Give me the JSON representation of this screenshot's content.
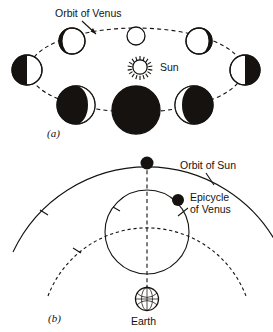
{
  "figure": {
    "title_visible": false,
    "background_color": "#ffffff",
    "ink_color": "#15120f"
  },
  "panel_a": {
    "panel_label": "(a)",
    "labels": {
      "orbit_of_venus": "Orbit of Venus",
      "sun": "Sun"
    },
    "sun_icon_name": "sun-with-rays-icon",
    "orbit": {
      "type": "ellipse-dashed",
      "center_x": 136,
      "center_y": 70,
      "radius_x": 107,
      "radius_y": 42
    },
    "phases": [
      {
        "position": "left",
        "phase": "half-lit-left-dark",
        "cx": 27,
        "cy": 70,
        "r": 15,
        "dark_side": "left",
        "fraction_dark": 0.5
      },
      {
        "position": "upper-left",
        "phase": "gibbous-thin-crescent-dark-left",
        "cx": 72,
        "cy": 41,
        "r": 13,
        "dark_side": "left",
        "fraction_dark": 0.18
      },
      {
        "position": "top",
        "phase": "full-bright",
        "cx": 136,
        "cy": 36,
        "r": 9,
        "dark_side": "none",
        "fraction_dark": 0.0
      },
      {
        "position": "upper-right",
        "phase": "gibbous-thin-crescent-dark-right",
        "cx": 199,
        "cy": 41,
        "r": 13,
        "dark_side": "right",
        "fraction_dark": 0.18
      },
      {
        "position": "right",
        "phase": "half-lit-right-dark",
        "cx": 245,
        "cy": 70,
        "r": 15,
        "dark_side": "right",
        "fraction_dark": 0.5
      },
      {
        "position": "lower-right",
        "phase": "crescent-thin-bright-left",
        "cx": 194,
        "cy": 105,
        "r": 19,
        "dark_side": "most",
        "fraction_dark": 0.85
      },
      {
        "position": "bottom",
        "phase": "new-fully-dark",
        "cx": 136,
        "cy": 110,
        "r": 24,
        "dark_side": "all",
        "fraction_dark": 1.0
      },
      {
        "position": "lower-left",
        "phase": "crescent-thin-bright-right",
        "cx": 76,
        "cy": 105,
        "r": 19,
        "dark_side": "most",
        "fraction_dark": 0.85
      }
    ]
  },
  "panel_b": {
    "panel_label": "(b)",
    "labels": {
      "orbit_of_sun": "Orbit of Sun",
      "epicycle_of_venus_line1": "Epicycle",
      "epicycle_of_venus_line2": "of Venus",
      "earth": "Earth"
    },
    "earth_icon_name": "globe-icon",
    "sun_marker": {
      "cx": 147,
      "cy": 163,
      "r": 6.5,
      "fill": "#15120f"
    },
    "venus_marker": {
      "cx": 178,
      "cy": 200,
      "r": 6.0,
      "fill": "#15120f"
    },
    "deferent_arc": {
      "type": "solid-arc",
      "center_x": 147,
      "center_y": 311,
      "radius": 148
    },
    "epicycle": {
      "type": "solid-circle",
      "center_x": 147,
      "center_y": 232,
      "radius": 42
    },
    "inner_arc": {
      "type": "dashed-arc",
      "center_x": 147,
      "center_y": 311,
      "radius": 106
    },
    "radius_line": {
      "type": "dashed-line",
      "from_x": 147,
      "from_y": 163,
      "to_x": 147,
      "to_y": 290
    },
    "earth_globe": {
      "cx": 147,
      "cy": 299,
      "r": 12
    }
  }
}
